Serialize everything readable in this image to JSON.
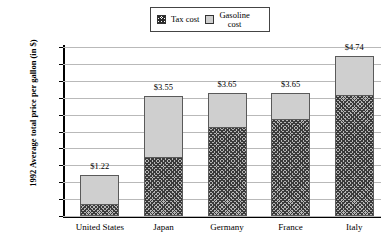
{
  "legend": {
    "position": "top-center",
    "items": [
      {
        "label": "Tax cost",
        "swatch": "hatch-swatch-icon"
      },
      {
        "label_line1": "Gasoline",
        "label_line2": "cost",
        "swatch": "gray-swatch-icon"
      }
    ]
  },
  "chart_data": {
    "type": "bar",
    "subtype": "stacked",
    "title": "",
    "xlabel": "",
    "ylabel": "1992 Average total price per gallon (in $)",
    "ylim": [
      0.0,
      5.0
    ],
    "ytick_step": 0.5,
    "grid": true,
    "categories": [
      "United States",
      "Japan",
      "Germany",
      "France",
      "Italy"
    ],
    "ytick_labels": [
      "0.00",
      "0.50",
      "1.00",
      "1.50",
      "2.00",
      "2.50",
      "3.00",
      "3.50",
      "4.00",
      "4.50",
      "5.00"
    ],
    "series": [
      {
        "name": "Tax cost",
        "values": [
          0.35,
          1.75,
          2.65,
          2.9,
          3.6
        ]
      },
      {
        "name": "Gasoline cost",
        "values": [
          0.87,
          1.8,
          1.0,
          0.75,
          1.14
        ]
      }
    ],
    "totals": [
      1.22,
      3.55,
      3.65,
      3.65,
      4.74
    ],
    "total_labels": [
      "$1.22",
      "$3.55",
      "$3.65",
      "$3.65",
      "$4.74"
    ]
  }
}
